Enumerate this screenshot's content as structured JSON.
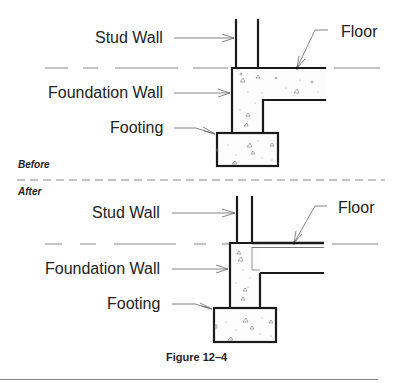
{
  "figure": {
    "caption": "Figure 12–4",
    "before": {
      "section_label": "Before",
      "labels": {
        "stud_wall": "Stud Wall",
        "foundation_wall": "Foundation Wall",
        "footing": "Footing",
        "floor": "Floor"
      }
    },
    "after": {
      "section_label": "After",
      "labels": {
        "stud_wall": "Stud Wall",
        "foundation_wall": "Foundation Wall",
        "footing": "Footing",
        "floor": "Floor"
      }
    }
  },
  "colors": {
    "line": "#1a1a1a",
    "leader": "#666666",
    "dashed": "#888888",
    "text": "#222222"
  }
}
